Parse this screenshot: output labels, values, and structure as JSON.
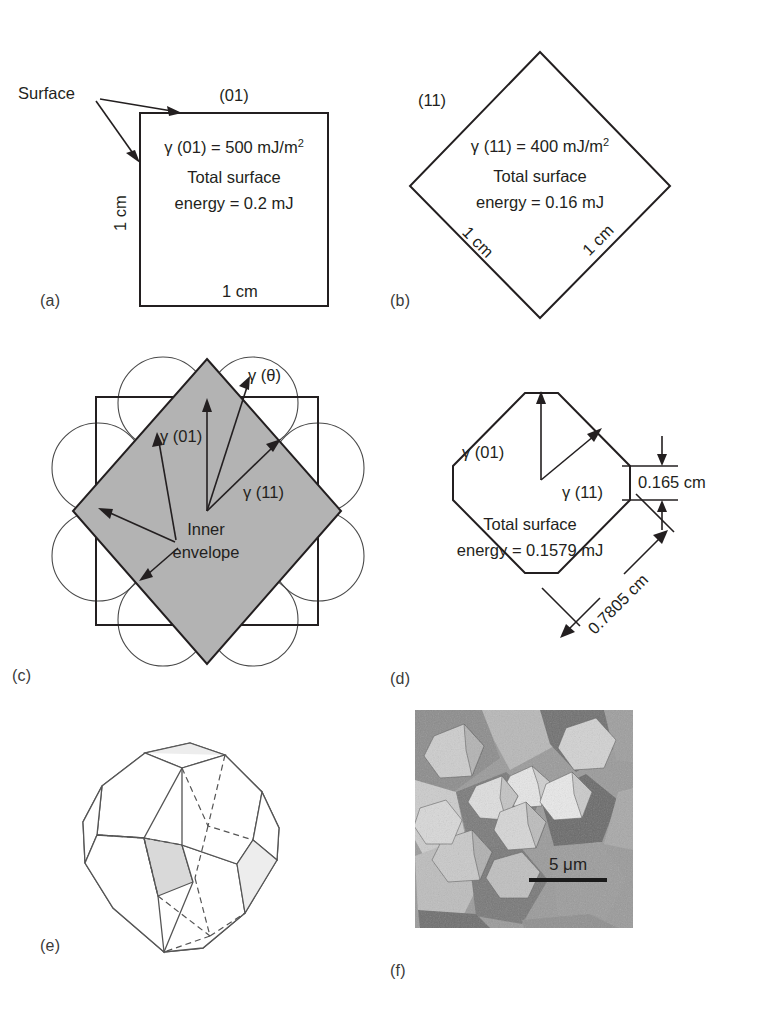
{
  "figure": {
    "domain": "Diagram"
  },
  "panels": {
    "a": {
      "label": "(a)",
      "callout": "Surface",
      "top_face_index": "(01)",
      "line1_gamma": "γ (01)",
      "line1_rest": " = 500 mJ/m",
      "line1_exp": "2",
      "line2": "Total surface",
      "line3": "energy = 0.2 mJ",
      "left_dim": "1 cm",
      "bottom_dim": "1 cm"
    },
    "b": {
      "label": "(b)",
      "face_index": "(11)",
      "line1_gamma": "γ (11)",
      "line1_rest": " = 400 mJ/m",
      "line1_exp": "2",
      "line2": "Total surface",
      "line3": "energy = 0.16 mJ",
      "left_dim": "1 cm",
      "right_dim": "1 cm"
    },
    "c": {
      "label": "(c)",
      "gamma_theta": "γ (θ)",
      "gamma_01": "γ (01)",
      "gamma_11": "γ (11)",
      "inner_line1": "Inner",
      "inner_line2": "envelope"
    },
    "d": {
      "label": "(d)",
      "gamma_01": "γ (01)",
      "gamma_11": "γ (11)",
      "line2": "Total surface",
      "line3": "energy = 0.1579 mJ",
      "dim_short": "0.165 cm",
      "dim_long": "0.7805 cm"
    },
    "e": {
      "label": "(e)"
    },
    "f": {
      "label": "(f)",
      "scale_bar": "5 μm"
    }
  },
  "colors": {
    "ink": "#231f20",
    "shade_gray": "#b3b3b3",
    "facet_gray": "#d9d9d9",
    "line_gray": "#555555"
  }
}
